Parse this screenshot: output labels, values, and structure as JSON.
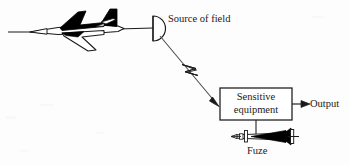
{
  "figure": {
    "type": "schematic-diagram",
    "background_color": "#fdfdfd",
    "ink_color": "#1a1a1a"
  },
  "labels": {
    "source_of_field": "Source of field",
    "sensitive_equipment_line1": "Sensitive",
    "sensitive_equipment_line2": "equipment",
    "output": "Output",
    "fuze": "Fuze"
  },
  "nodes": [
    {
      "name": "aircraft",
      "label": "",
      "shape": "swept-wing bomber silhouette, nose pointing left",
      "x": 8,
      "y": 8,
      "width": 128,
      "height": 48
    },
    {
      "name": "antenna-dish",
      "label": "Source of field",
      "shape": "half-disc radiator, flat edge left, dome right",
      "x": 152,
      "y": 15,
      "width": 14,
      "height": 26
    },
    {
      "name": "sensitive-equipment-box",
      "label": "Sensitive equipment",
      "shape": "rectangle",
      "x": 220,
      "y": 88,
      "width": 72,
      "height": 32
    },
    {
      "name": "fuze-missile",
      "label": "Fuze",
      "shape": "missile with black flared tail, nose pointing left",
      "x": 232,
      "y": 129,
      "width": 70,
      "height": 15
    }
  ],
  "connectors": [
    {
      "name": "aircraft-to-dish-boom",
      "from": "aircraft",
      "to": "antenna-dish",
      "style": "plain-line",
      "arrowhead": "none"
    },
    {
      "name": "field-radiation-arrow",
      "from": "antenna-dish",
      "to": "sensitive-equipment-box",
      "style": "line-with-lightning-zigzag",
      "arrowhead": "solid-filled"
    },
    {
      "name": "output-arrow",
      "from": "sensitive-equipment-box",
      "to": "output",
      "style": "plain-line",
      "arrowhead": "solid-filled"
    },
    {
      "name": "equipment-to-fuze-link",
      "from": "sensitive-equipment-box",
      "to": "fuze-missile",
      "style": "plain-line",
      "arrowhead": "none"
    }
  ]
}
